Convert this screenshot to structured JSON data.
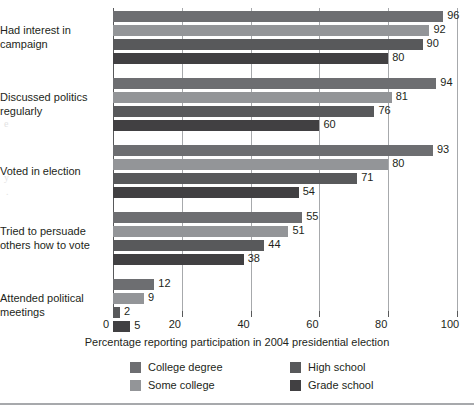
{
  "chart_data": {
    "type": "bar",
    "orientation": "horizontal",
    "title": "",
    "xlabel": "Percentage reporting participation in 2004 presidential election",
    "ylabel": "",
    "xlim": [
      0,
      100
    ],
    "xticks": [
      0,
      20,
      40,
      60,
      80,
      100
    ],
    "xtick_labels": [
      "0",
      "20",
      "40",
      "60",
      "80",
      "100"
    ],
    "grid": true,
    "grid_axis": "x",
    "legend_position": "bottom",
    "categories": [
      "Had interest in campaign",
      "Discussed politics regularly",
      "Voted in election",
      "Tried to persuade others how to vote",
      "Attended political meetings"
    ],
    "category_lines": [
      [
        "Had interest in",
        "campaign"
      ],
      [
        "Discussed politics",
        "regularly"
      ],
      [
        "Voted in election"
      ],
      [
        "Tried to persuade",
        "others how to vote"
      ],
      [
        "Attended political",
        "meetings"
      ]
    ],
    "series": [
      {
        "name": "College degree",
        "color": "#6d6e71",
        "values": [
          96,
          94,
          93,
          55,
          12
        ]
      },
      {
        "name": "Some college",
        "color": "#939598",
        "values": [
          92,
          81,
          80,
          51,
          9
        ]
      },
      {
        "name": "High school",
        "color": "#58595b",
        "values": [
          90,
          76,
          71,
          44,
          2
        ]
      },
      {
        "name": "Grade school",
        "color": "#414042",
        "values": [
          80,
          60,
          54,
          38,
          5
        ]
      }
    ]
  },
  "legend": {
    "items": [
      {
        "label": "College degree",
        "color": "#6d6e71"
      },
      {
        "label": "Some college",
        "color": "#939598"
      },
      {
        "label": "High school",
        "color": "#58595b"
      },
      {
        "label": "Grade school",
        "color": "#414042"
      }
    ]
  },
  "axis": {
    "x_title": "Percentage reporting participation in 2004 presidential election",
    "ticks": [
      "0",
      "20",
      "40",
      "60",
      "80",
      "100"
    ]
  },
  "colors": {
    "gridline": "#a7a9ac",
    "axis": "#58595b",
    "text": "#231f20",
    "background": "#ffffff",
    "rule": "#a7a9ac"
  },
  "bleed_marks": [
    "e",
    "y",
    "."
  ]
}
